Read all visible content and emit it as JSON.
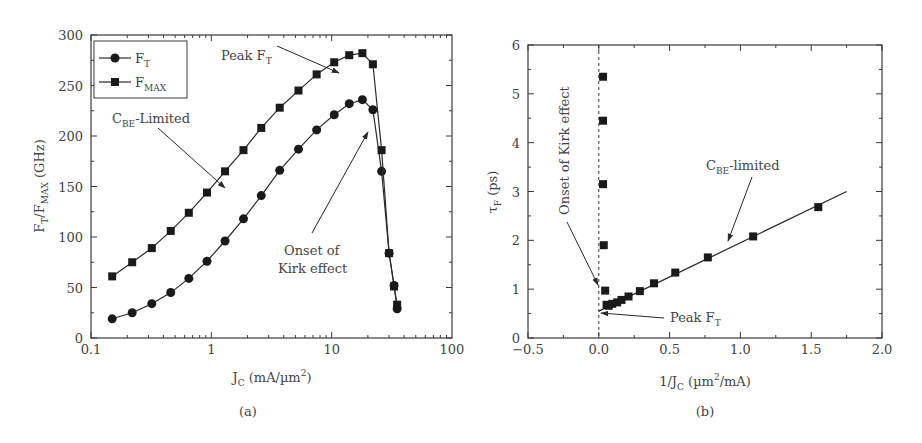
{
  "chart_data": [
    {
      "panel": "(a)",
      "type": "line",
      "title": "",
      "xlabel": "J_C (mA/µm²)",
      "ylabel": "F_T/F_MAX (GHz)",
      "xscale": "log",
      "xlim": [
        0.1,
        100
      ],
      "ylim": [
        0,
        300
      ],
      "xticks": [
        "0.1",
        "1",
        "10",
        "100"
      ],
      "yticks": [
        "0",
        "50",
        "100",
        "150",
        "200",
        "250",
        "300"
      ],
      "grid": false,
      "legend_position": "upper-left",
      "series": [
        {
          "name": "F_T",
          "marker": "circle",
          "x": [
            0.15,
            0.22,
            0.32,
            0.46,
            0.65,
            0.92,
            1.3,
            1.85,
            2.6,
            3.7,
            5.3,
            7.5,
            10.5,
            14,
            18,
            22,
            26,
            30,
            33,
            35
          ],
          "y": [
            19,
            25,
            34,
            45,
            59,
            76,
            96,
            118,
            141,
            166,
            187,
            206,
            221,
            232,
            236,
            226,
            165,
            84,
            52,
            29
          ]
        },
        {
          "name": "F_MAX",
          "marker": "square",
          "x": [
            0.15,
            0.22,
            0.32,
            0.46,
            0.65,
            0.92,
            1.3,
            1.85,
            2.6,
            3.7,
            5.3,
            7.5,
            10.5,
            14,
            18,
            22,
            26,
            30,
            33,
            35
          ],
          "y": [
            61,
            75,
            89,
            106,
            124,
            144,
            165,
            186,
            208,
            228,
            245,
            261,
            273,
            280,
            282,
            271,
            186,
            84,
            51,
            33
          ]
        }
      ],
      "annotations": [
        "Peak F_T",
        "C_BE-Limited",
        "Onset of Kirk effect"
      ]
    },
    {
      "panel": "(b)",
      "type": "scatter",
      "title": "",
      "xlabel": "1/J_C (µm²/mA)",
      "ylabel": "τ_F (ps)",
      "xlim": [
        -0.5,
        2.0
      ],
      "ylim": [
        0,
        6
      ],
      "xticks": [
        "-0.5",
        "0.0",
        "0.5",
        "1.0",
        "1.5",
        "2.0"
      ],
      "yticks": [
        "0",
        "1",
        "2",
        "3",
        "4",
        "5",
        "6"
      ],
      "grid": false,
      "series": [
        {
          "name": "τ_F",
          "marker": "square",
          "x": [
            0.03,
            0.03,
            0.03,
            0.035,
            0.045,
            0.055,
            0.07,
            0.095,
            0.13,
            0.16,
            0.21,
            0.29,
            0.39,
            0.54,
            0.77,
            1.09,
            1.55
          ],
          "y": [
            5.35,
            4.45,
            3.15,
            1.9,
            0.97,
            0.68,
            0.66,
            0.7,
            0.73,
            0.78,
            0.85,
            0.96,
            1.12,
            1.34,
            1.65,
            2.08,
            2.68
          ]
        },
        {
          "name": "linear fit",
          "type": "line",
          "x": [
            0.0,
            1.75
          ],
          "y": [
            0.55,
            3.0
          ]
        }
      ],
      "reference_line": {
        "x": 0.0,
        "style": "dashed"
      },
      "annotations": [
        "Onset of Kirk effect",
        "C_BE-limited",
        "Peak F_T"
      ]
    }
  ],
  "panel_a": {
    "caption": "(a)",
    "yticks": [
      "0",
      "50",
      "100",
      "150",
      "200",
      "250",
      "300"
    ],
    "xticks": [
      "0.1",
      "1",
      "10",
      "100"
    ],
    "ylabel_main": "F",
    "ylabel_sub1": "T",
    "ylabel_mid": "/F",
    "ylabel_sub2": "MAX",
    "ylabel_end": " (GHz)",
    "xlabel_main": "J",
    "xlabel_sub": "C",
    "xlabel_end": " (mA/µm",
    "xlabel_sup": "2",
    "xlabel_close": ")",
    "legend": [
      {
        "main": "F",
        "sub": "T"
      },
      {
        "main": "F",
        "sub": "MAX"
      }
    ],
    "annot_peak": {
      "main": "Peak F",
      "sub": "T"
    },
    "annot_cbe": {
      "main": "C",
      "sub": "BE",
      "end": "-Limited"
    },
    "annot_kirk_1": "Onset of",
    "annot_kirk_2": "Kirk effect"
  },
  "panel_b": {
    "caption": "(b)",
    "yticks": [
      "0",
      "1",
      "2",
      "3",
      "4",
      "5",
      "6"
    ],
    "xticks": [
      "−0.5",
      "0.0",
      "0.5",
      "1.0",
      "1.5",
      "2.0"
    ],
    "ylabel_main": "τ",
    "ylabel_sub": "F",
    "ylabel_end": " (ps)",
    "xlabel_main": "1/J",
    "xlabel_sub": "C",
    "xlabel_end": " (µm",
    "xlabel_sup": "2",
    "xlabel_close": "/mA)",
    "annot_kirk": "Onset of Kirk effect",
    "annot_cbe": {
      "main": "C",
      "sub": "BE",
      "end": "-limited"
    },
    "annot_peak": {
      "main": "Peak F",
      "sub": "T"
    }
  },
  "colors": {
    "axis": "#3a3a3a",
    "marker": "#1a1a1a",
    "text": "#444444"
  }
}
